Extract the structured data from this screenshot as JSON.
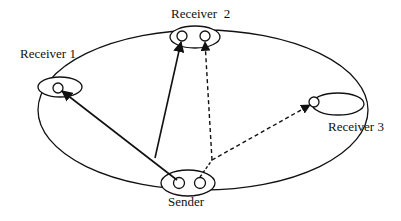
{
  "diagram": {
    "type": "multicast-network",
    "nodes": [
      {
        "id": "receiver1",
        "label": "Receiver 1"
      },
      {
        "id": "receiver2",
        "label": "Receiver  2"
      },
      {
        "id": "receiver3",
        "label": "Receiver 3"
      },
      {
        "id": "sender",
        "label": "Sender"
      }
    ],
    "edges": [
      {
        "from": "sender",
        "to": "receiver1",
        "style": "solid"
      },
      {
        "from": "sender",
        "to": "receiver2",
        "style": "solid"
      },
      {
        "from": "sender",
        "to": "receiver2",
        "style": "dashed"
      },
      {
        "from": "sender",
        "to": "receiver3",
        "style": "dashed"
      }
    ],
    "colors": {
      "stroke": "#111111",
      "background": "#ffffff"
    }
  }
}
